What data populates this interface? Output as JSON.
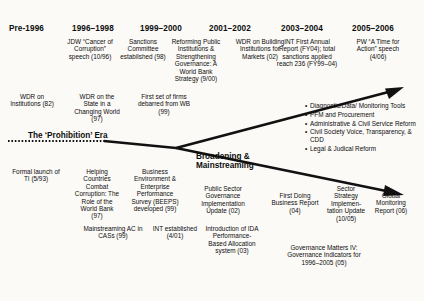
{
  "diagram": {
    "background_color": "#fbfaf7",
    "line_color": "#111111"
  },
  "headers": [
    {
      "label": "Pre-1996",
      "x": 9,
      "y": 24
    },
    {
      "label": "1996–1998",
      "x": 72,
      "y": 24
    },
    {
      "label": "1999–2000",
      "x": 140,
      "y": 24
    },
    {
      "label": "2001–2002",
      "x": 209,
      "y": 24
    },
    {
      "label": "2003–2004",
      "x": 281,
      "y": 24
    },
    {
      "label": "2005–2006",
      "x": 352,
      "y": 24
    }
  ],
  "events_row1": [
    {
      "text": "JDW “Cancer of Corruption” speech (10/96)",
      "x": 64,
      "y": 38,
      "w": 52
    },
    {
      "text": "Sanctions Committee established (98)",
      "x": 118,
      "y": 38,
      "w": 48
    },
    {
      "text": "Reforming Public Institutions & Strengthening Governance: A World Bank Strategy (9/00)",
      "x": 168,
      "y": 38,
      "w": 56
    },
    {
      "text": "WDR on Building Institutions for Markets (02)",
      "x": 232,
      "y": 38,
      "w": 56
    },
    {
      "text": "INT First Annual Report (FY04); total sanctions applied reach 236 (FY99–04)",
      "x": 276,
      "y": 38,
      "w": 62
    },
    {
      "text": "PW “A Time for Action” speech (4/06)",
      "x": 352,
      "y": 38,
      "w": 56
    }
  ],
  "events_row2": [
    {
      "text": "WDR on Institutions (82)",
      "x": 8,
      "y": 93,
      "w": 52
    },
    {
      "text": "WDR on the State in a Changing World (97)",
      "x": 74,
      "y": 93,
      "w": 50
    },
    {
      "text": "First set of firms debarred from WB (99)",
      "x": 136,
      "y": 93,
      "w": 56
    }
  ],
  "events_row3": [
    {
      "text": "Formal launch of TI (5/93)",
      "x": 12,
      "y": 168,
      "w": 52
    },
    {
      "text": "Helping Countries Combat Corruption: The Role of the World Bank (97)",
      "x": 74,
      "y": 168,
      "w": 46
    },
    {
      "text": "Business Environment & Enterprise Performance Survey (BEEPS) developed (99)",
      "x": 126,
      "y": 168,
      "w": 58
    },
    {
      "text": "Public Sector Governance Implementation Update (02)",
      "x": 192,
      "y": 185,
      "w": 62
    },
    {
      "text": "First Doing Business Report (04)",
      "x": 272,
      "y": 192,
      "w": 50
    },
    {
      "text": "Sector Strategy Implemen-tation Update (10/05)",
      "x": 328,
      "y": 185,
      "w": 40
    },
    {
      "text": "Global Monitoring Report (06)",
      "x": 370,
      "y": 192,
      "w": 42
    }
  ],
  "events_row4": [
    {
      "text": "Mainstreaming AC in CASs (99)",
      "x": 82,
      "y": 226,
      "w": 62
    },
    {
      "text": "INT established (4/01)",
      "x": 152,
      "y": 226,
      "w": 46
    },
    {
      "text": "Introduction of IDA Performance-Based Allocation system (03)",
      "x": 204,
      "y": 226,
      "w": 56
    },
    {
      "text": "Governance Matters IV: Governance Indicators for 1996–2005 (05)",
      "x": 288,
      "y": 244,
      "w": 76
    }
  ],
  "era_label": {
    "text": "The ‘Prohibition’ Era",
    "x": 28,
    "y": 131
  },
  "branch_label": {
    "line1": "Broadening &",
    "line2": "Mainstreaming",
    "x": 196,
    "y": 153
  },
  "bullets": [
    "Diagnostic/Data/ Monitoring Tools",
    "PFM and Procurement",
    "Administrative & Civil Service Reform",
    "Civil Society Voice, Transparency, & CDD",
    "Legal & Judical Reform"
  ],
  "bullets_pos": {
    "x": 305,
    "y": 103
  }
}
